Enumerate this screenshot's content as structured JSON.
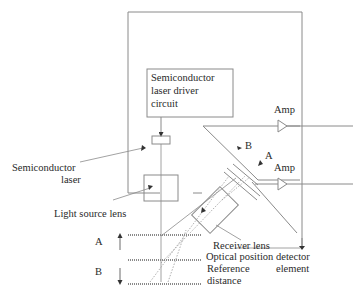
{
  "diagram": {
    "type": "optical triangulation displacement sensor schematic",
    "colors": {
      "line": "#8a8a8a",
      "text": "#2a2a2a",
      "background": "#ffffff"
    },
    "driver_box": {
      "line1": "Semiconductor",
      "line2": "laser driver",
      "line3": "circuit"
    },
    "labels": {
      "semiconductor_laser_1": "Semiconductor",
      "semiconductor_laser_2": "laser",
      "light_source_lens": "Light source lens",
      "receiver_lens": "Receiver lens",
      "optical_psd_1": "Optical position detector",
      "optical_psd_2": "element",
      "reference_1": "Reference",
      "reference_2": "distance",
      "amp_top": "Amp",
      "amp_bottom": "Amp",
      "psd_a": "A",
      "psd_b": "B",
      "target_a": "A",
      "target_b": "B"
    }
  }
}
